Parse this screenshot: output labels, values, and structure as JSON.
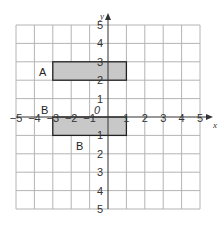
{
  "diagram": {
    "type": "coordinate-grid",
    "x_axis": {
      "label": "x",
      "min": -5,
      "max": 5,
      "ticks": [
        "−5",
        "−4",
        "−3",
        "−2",
        "−1",
        "1",
        "2",
        "3",
        "4",
        "5"
      ]
    },
    "y_axis": {
      "label": "y",
      "min": -5,
      "max": 5,
      "ticks": [
        "5",
        "4",
        "3",
        "2",
        "1",
        "1",
        "2",
        "3",
        "4",
        "5"
      ]
    },
    "origin_label": "0",
    "shapes": [
      {
        "id": "A",
        "label": "A",
        "x1": -3,
        "y1": 2,
        "x2": 1,
        "y2": 3,
        "fill": "#c8c8c8"
      },
      {
        "id": "B",
        "label": "B",
        "x1": -3,
        "y1": -1,
        "x2": 1,
        "y2": 0,
        "fill": "#c8c8c8"
      }
    ],
    "label_positions": {
      "A": "left of rectangle A",
      "B_upper": "above-left of rectangle B",
      "B_lower": "below rectangle B"
    },
    "colors": {
      "grid": "#b4b4b4",
      "axis": "#333333",
      "outline": "#222222",
      "fill": "#c8c8c8"
    }
  },
  "labels": {
    "x_axis": "x",
    "y_axis": "y",
    "origin": "0",
    "shape_a": "A",
    "shape_b_top": "B",
    "shape_b_bottom": "B",
    "xt_m5": "−5",
    "xt_m4": "−4",
    "xt_m3": "−3",
    "xt_m2": "−2",
    "xt_m1": "−1",
    "xt_1": "1",
    "xt_2": "2",
    "xt_3": "3",
    "xt_4": "4",
    "xt_5": "5",
    "yt_5": "5",
    "yt_4": "4",
    "yt_3": "3",
    "yt_2": "2",
    "yt_1": "1",
    "yt_m1": "1",
    "yt_m2": "2",
    "yt_m3": "3",
    "yt_m4": "4",
    "yt_m5": "5"
  }
}
